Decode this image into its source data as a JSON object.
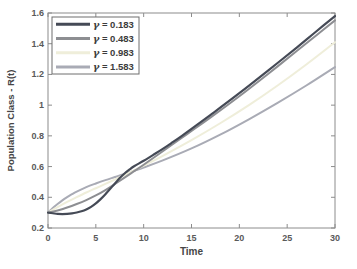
{
  "figure": {
    "background": "#ffffff",
    "axes_box_color": "#8c8c8c",
    "tick_label_color": "#5a5a5a",
    "axis_label_color": "#464646",
    "legend": {
      "border_color": "#6e6e6e",
      "background": "#ffffff",
      "text_color": "#3c3c3c",
      "entries": [
        {
          "symbol": "γ",
          "eq": " = ",
          "value": "0.183",
          "color": "#454a56"
        },
        {
          "symbol": "γ",
          "eq": " = ",
          "value": "0.483",
          "color": "#8d8e92"
        },
        {
          "symbol": "γ",
          "eq": " = ",
          "value": "0.983",
          "color": "#efeeda"
        },
        {
          "symbol": "γ",
          "eq": " = ",
          "value": "1.583",
          "color": "#a9abb5"
        }
      ]
    }
  },
  "chart_data": {
    "type": "line",
    "title": "",
    "xlabel": "Time",
    "ylabel": "Population Class - R(t)",
    "xlim": [
      0,
      30
    ],
    "ylim": [
      0.2,
      1.6
    ],
    "xticks": {
      "values": [
        0,
        5,
        10,
        15,
        20,
        25,
        30
      ],
      "labels": [
        "0",
        "5",
        "10",
        "15",
        "20",
        "25",
        "30"
      ]
    },
    "yticks": {
      "values": [
        0.2,
        0.4,
        0.6,
        0.8,
        1.0,
        1.2,
        1.4,
        1.6
      ],
      "labels": [
        "0.2",
        "0.4",
        "0.6",
        "0.8",
        "1",
        "1.2",
        "1.4",
        "1.6"
      ]
    },
    "grid": false,
    "legend_position": "northwest",
    "series": [
      {
        "name": "γ = 0.183",
        "color": "#454a56",
        "width": 2.2,
        "points": [
          [
            0,
            0.3
          ],
          [
            0.5,
            0.296
          ],
          [
            1,
            0.292
          ],
          [
            1.5,
            0.291
          ],
          [
            2,
            0.292
          ],
          [
            2.5,
            0.295
          ],
          [
            3,
            0.301
          ],
          [
            3.5,
            0.309
          ],
          [
            4,
            0.321
          ],
          [
            4.5,
            0.338
          ],
          [
            5,
            0.36
          ],
          [
            5.5,
            0.388
          ],
          [
            6,
            0.42
          ],
          [
            6.5,
            0.455
          ],
          [
            7,
            0.49
          ],
          [
            7.5,
            0.525
          ],
          [
            8,
            0.555
          ],
          [
            8.5,
            0.58
          ],
          [
            9,
            0.602
          ],
          [
            10,
            0.638
          ],
          [
            11,
            0.676
          ],
          [
            12,
            0.715
          ],
          [
            13,
            0.757
          ],
          [
            14,
            0.8
          ],
          [
            15,
            0.845
          ],
          [
            17,
            0.937
          ],
          [
            20,
            1.078
          ],
          [
            23,
            1.225
          ],
          [
            26,
            1.375
          ],
          [
            28,
            1.478
          ],
          [
            30,
            1.58
          ]
        ]
      },
      {
        "name": "γ = 0.483",
        "color": "#8d8e92",
        "width": 2.0,
        "points": [
          [
            0,
            0.3
          ],
          [
            1,
            0.314
          ],
          [
            2,
            0.333
          ],
          [
            3,
            0.356
          ],
          [
            4,
            0.382
          ],
          [
            5,
            0.412
          ],
          [
            6,
            0.447
          ],
          [
            7,
            0.487
          ],
          [
            8,
            0.528
          ],
          [
            9,
            0.57
          ],
          [
            10,
            0.612
          ],
          [
            12,
            0.7
          ],
          [
            14,
            0.788
          ],
          [
            15,
            0.832
          ],
          [
            17,
            0.92
          ],
          [
            20,
            1.058
          ],
          [
            23,
            1.203
          ],
          [
            26,
            1.352
          ],
          [
            28,
            1.452
          ],
          [
            30,
            1.552
          ]
        ]
      },
      {
        "name": "γ = 0.983",
        "color": "#efeeda",
        "width": 2.0,
        "points": [
          [
            0,
            0.3
          ],
          [
            1,
            0.336
          ],
          [
            2,
            0.37
          ],
          [
            3,
            0.401
          ],
          [
            4,
            0.431
          ],
          [
            5,
            0.459
          ],
          [
            6,
            0.487
          ],
          [
            7,
            0.516
          ],
          [
            8,
            0.545
          ],
          [
            10,
            0.606
          ],
          [
            12,
            0.67
          ],
          [
            15,
            0.772
          ],
          [
            18,
            0.882
          ],
          [
            21,
            1.0
          ],
          [
            24,
            1.128
          ],
          [
            27,
            1.265
          ],
          [
            30,
            1.41
          ]
        ]
      },
      {
        "name": "γ = 1.583",
        "color": "#a9abb5",
        "width": 2.0,
        "points": [
          [
            0,
            0.3
          ],
          [
            0.5,
            0.33
          ],
          [
            1,
            0.356
          ],
          [
            1.5,
            0.38
          ],
          [
            2,
            0.401
          ],
          [
            2.5,
            0.42
          ],
          [
            3,
            0.437
          ],
          [
            4,
            0.466
          ],
          [
            5,
            0.49
          ],
          [
            6,
            0.512
          ],
          [
            7,
            0.532
          ],
          [
            8,
            0.552
          ],
          [
            10,
            0.594
          ],
          [
            12,
            0.64
          ],
          [
            15,
            0.718
          ],
          [
            18,
            0.808
          ],
          [
            21,
            0.908
          ],
          [
            24,
            1.015
          ],
          [
            27,
            1.128
          ],
          [
            30,
            1.248
          ]
        ]
      }
    ]
  }
}
